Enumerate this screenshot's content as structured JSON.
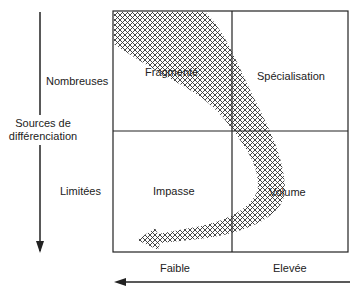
{
  "y_axis": {
    "title_line1": "Sources de",
    "title_line2": "différenciation",
    "high_label": "Nombreuses",
    "low_label": "Limitées"
  },
  "x_axis": {
    "left_label": "Faible",
    "right_label": "Elevée"
  },
  "quadrants": {
    "top_left": "Fragmenté",
    "top_right": "Spécialisation",
    "bottom_left": "Impasse",
    "bottom_right": "Volume"
  },
  "colors": {
    "line": "#222222",
    "hatch": "#333333",
    "background": "#ffffff"
  }
}
